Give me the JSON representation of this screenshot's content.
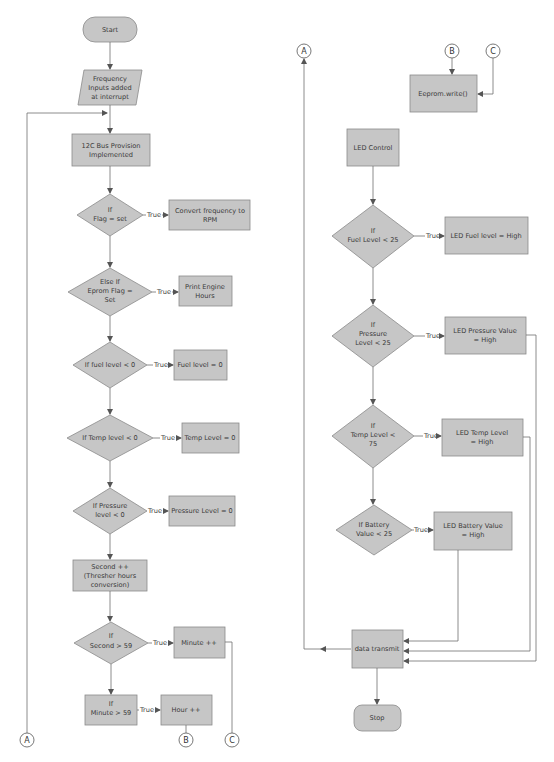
{
  "diagram": {
    "type": "flowchart",
    "colors": {
      "shape_fill": "#c6c6c6",
      "shape_stroke": "#8a8a8a",
      "line": "#6e6e6e",
      "text": "#3a3a3a"
    },
    "edge_label_true": "True",
    "connectors": {
      "a": "A",
      "b": "B",
      "c": "C"
    },
    "left_column": {
      "start": "Start",
      "input": [
        "Frequency",
        "Inputs added",
        "at interrupt"
      ],
      "i2c": [
        "12C Bus Provision",
        "Implemented"
      ],
      "if_flag": [
        "If",
        "Flag = set"
      ],
      "convert_rpm": [
        "Convert frequency to",
        "RPM"
      ],
      "else_if_eprom": [
        "Else If",
        "Eprom Flag =",
        "Set"
      ],
      "print_hours": [
        "Print Engine",
        "Hours"
      ],
      "if_fuel": [
        "If fuel level < 0"
      ],
      "fuel_zero": [
        "Fuel level = 0"
      ],
      "if_temp": [
        "If Temp level < 0"
      ],
      "temp_zero": [
        "Temp Level = 0"
      ],
      "if_pressure": [
        "If Pressure",
        "level < 0"
      ],
      "pressure_zero": [
        "Pressure Level = 0"
      ],
      "second_inc": [
        "Second ++",
        "(Thresher hours",
        "conversion)"
      ],
      "if_second": [
        "If",
        "Second > 59"
      ],
      "minute_inc": [
        "Minute ++"
      ],
      "if_minute": [
        "If",
        "Minute > 59"
      ],
      "hour_inc": [
        "Hour ++"
      ]
    },
    "right_column": {
      "eeprom_write": [
        "Eeprom.write()"
      ],
      "led_control": [
        "LED Control"
      ],
      "if_fuel": [
        "If",
        "Fuel Level < 25"
      ],
      "led_fuel": [
        "LED Fuel level = High"
      ],
      "if_pressure": [
        "If",
        "Pressure",
        "Level < 25"
      ],
      "led_pressure": [
        "LED Pressure Value",
        "= High"
      ],
      "if_temp": [
        "If",
        "Temp Level <",
        "75"
      ],
      "led_temp": [
        "LED Temp Level",
        "= High"
      ],
      "if_battery": [
        "If Battery",
        "Value < 25"
      ],
      "led_battery": [
        "LED Battery Value",
        "= High"
      ],
      "data_transmit": [
        "data transmit"
      ],
      "stop": "Stop"
    }
  }
}
